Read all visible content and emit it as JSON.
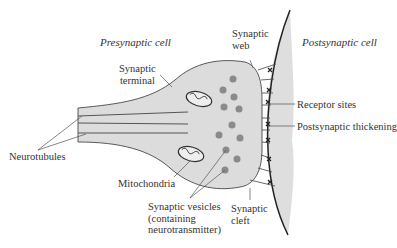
{
  "diagram": {
    "regions": {
      "presynaptic": "Presynaptic cell",
      "postsynaptic": "Postsynaptic cell"
    },
    "labels": {
      "synaptic_terminal": [
        "Synaptic",
        "terminal"
      ],
      "synaptic_web": [
        "Synaptic",
        "web"
      ],
      "receptor_sites": "Receptor sites",
      "postsynaptic_thickening": "Postsynaptic thickening",
      "neurotubules": "Neurotubules",
      "mitochondria": "Mitochondria",
      "synaptic_vesicles": [
        "Synaptic vesicles",
        "(containing",
        "neurotransmitter)"
      ],
      "synaptic_cleft": [
        "Synaptic",
        "cleft"
      ]
    },
    "colors": {
      "cytoplasm": "#dcdcdc",
      "vesicle": "#8a8a8a",
      "membrane": "#222222",
      "label_text": "#333333"
    }
  }
}
